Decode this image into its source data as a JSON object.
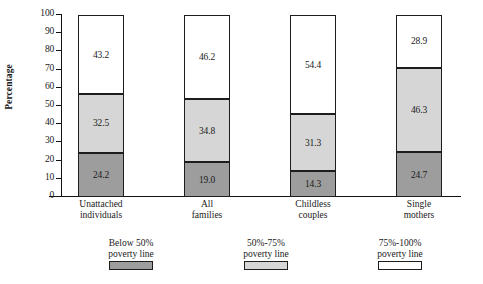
{
  "chart_data": {
    "type": "bar",
    "subtype": "stacked-bar-100",
    "title": "",
    "xlabel": "",
    "ylabel": "Percentage",
    "ylim": [
      0,
      100
    ],
    "ytick_labels": [
      "100",
      "90",
      "80",
      "70",
      "60",
      "50",
      "40",
      "30",
      "20",
      "10",
      "0"
    ],
    "ytick_values": [
      100,
      90,
      80,
      70,
      60,
      50,
      40,
      30,
      20,
      10,
      0
    ],
    "grid": false,
    "legend_position": "bottom",
    "categories": [
      "Unattached individuals",
      "All families",
      "Childless couples",
      "Single mothers"
    ],
    "category_lines": [
      [
        "Unattached",
        "individuals"
      ],
      [
        "All",
        "families"
      ],
      [
        "Childless",
        "couples"
      ],
      [
        "Single",
        "mothers"
      ]
    ],
    "series": [
      {
        "name": "Below 50% poverty line",
        "name_lines": [
          "Below 50%",
          "poverty line"
        ],
        "color": "#9d9d9d",
        "values": [
          24.2,
          19.0,
          14.3,
          24.7
        ],
        "labels": [
          "24.2",
          "19.0",
          "14.3",
          "24.7"
        ]
      },
      {
        "name": "50%-75% poverty line",
        "name_lines": [
          "50%-75%",
          "poverty line"
        ],
        "color": "#d6d6d6",
        "values": [
          32.5,
          34.8,
          31.3,
          46.3
        ],
        "labels": [
          "32.5",
          "34.8",
          "31.3",
          "46.3"
        ]
      },
      {
        "name": "75%-100% poverty line",
        "name_lines": [
          "75%-100%",
          "poverty line"
        ],
        "color": "#ffffff",
        "values": [
          43.2,
          46.2,
          54.4,
          28.9
        ],
        "labels": [
          "43.2",
          "46.2",
          "54.4",
          "28.9"
        ]
      }
    ]
  },
  "axis": {
    "y_title": "Percentage",
    "ticks": [
      "100",
      "90",
      "80",
      "70",
      "60",
      "50",
      "40",
      "30",
      "20",
      "10",
      "0"
    ]
  },
  "bars": [
    {
      "category_line1": "Unattached",
      "category_line2": "individuals",
      "below50": "24.2",
      "mid": "32.5",
      "top": "43.2"
    },
    {
      "category_line1": "All",
      "category_line2": "families",
      "below50": "19.0",
      "mid": "34.8",
      "top": "46.2"
    },
    {
      "category_line1": "Childless",
      "category_line2": "couples",
      "below50": "14.3",
      "mid": "31.3",
      "top": "54.4"
    },
    {
      "category_line1": "Single",
      "category_line2": "mothers",
      "below50": "24.7",
      "mid": "46.3",
      "top": "28.9"
    }
  ],
  "legend": [
    {
      "line1": "Below 50%",
      "line2": "poverty line",
      "color": "#9d9d9d"
    },
    {
      "line1": "50%-75%",
      "line2": "poverty line",
      "color": "#d6d6d6"
    },
    {
      "line1": "75%-100%",
      "line2": "poverty line",
      "color": "#ffffff"
    }
  ]
}
